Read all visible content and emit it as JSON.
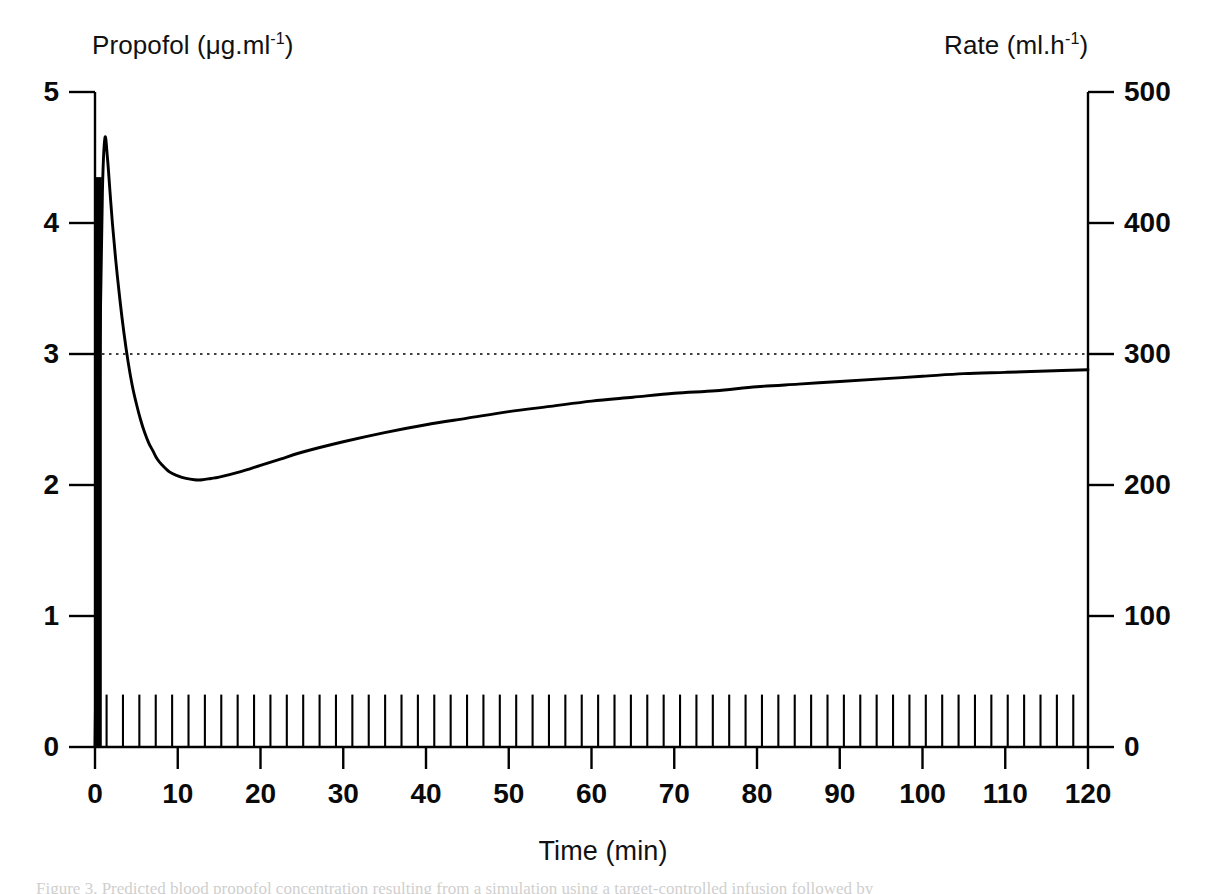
{
  "figure": {
    "left_axis_title_text": "Propofol (μg.ml",
    "left_axis_title_sup": "-1",
    "left_axis_title_close": ")",
    "right_axis_title_text": "Rate (ml.h",
    "right_axis_title_sup": "-1",
    "right_axis_title_close": ")",
    "x_axis_title": "Time (min)",
    "caption_partial": "Figure 3. Predicted blood propofol concentration resulting from a simulation using a target-controlled infusion followed by"
  },
  "chart_data": {
    "type": "line",
    "title": "",
    "xlabel": "Time (min)",
    "ylabel": "Propofol (μg.ml-1)",
    "y2label": "Rate (ml.h-1)",
    "xlim": [
      0,
      120
    ],
    "ylim": [
      0,
      5
    ],
    "y2lim": [
      0,
      500
    ],
    "grid": false,
    "legend": "none",
    "xticks": [
      0,
      10,
      20,
      30,
      40,
      50,
      60,
      70,
      80,
      90,
      100,
      110,
      120
    ],
    "xtick_labels": [
      "0",
      "10",
      "20",
      "30",
      "40",
      "50",
      "60",
      "70",
      "80",
      "90",
      "100",
      "110",
      "120"
    ],
    "yticks": [
      0,
      1,
      2,
      3,
      4,
      5
    ],
    "ytick_labels": [
      "0",
      "1",
      "2",
      "3",
      "4",
      "5"
    ],
    "y2ticks": [
      0,
      100,
      200,
      300,
      400,
      500
    ],
    "y2tick_labels": [
      "0",
      "100",
      "200",
      "300",
      "400",
      "500"
    ],
    "annotations": [
      {
        "name": "target-concentration-reference-line",
        "kind": "horizontal-dotted-line",
        "y": 3.0,
        "y2_equivalent": 300,
        "label": ""
      }
    ],
    "series": [
      {
        "name": "Predicted propofol blood concentration",
        "axis": "left",
        "style": "solid-line",
        "color": "#000000",
        "units": "μg.ml-1",
        "x": [
          0,
          0.3,
          0.6,
          0.9,
          1.2,
          1.5,
          1.8,
          2.1,
          2.5,
          3,
          3.5,
          4,
          4.5,
          5,
          5.5,
          6,
          6.5,
          7,
          7.5,
          8,
          9,
          10,
          11,
          12,
          13,
          14,
          15,
          17.5,
          20,
          22.5,
          25,
          30,
          35,
          40,
          45,
          50,
          55,
          60,
          65,
          70,
          75,
          80,
          85,
          90,
          95,
          100,
          105,
          110,
          115,
          120
        ],
        "y": [
          0.0,
          1.55,
          3.1,
          4.25,
          4.65,
          4.5,
          4.25,
          4.0,
          3.72,
          3.42,
          3.16,
          2.94,
          2.76,
          2.62,
          2.5,
          2.4,
          2.32,
          2.26,
          2.2,
          2.16,
          2.1,
          2.07,
          2.05,
          2.04,
          2.04,
          2.05,
          2.06,
          2.1,
          2.15,
          2.2,
          2.25,
          2.33,
          2.4,
          2.46,
          2.51,
          2.56,
          2.6,
          2.64,
          2.67,
          2.7,
          2.72,
          2.75,
          2.77,
          2.79,
          2.81,
          2.83,
          2.85,
          2.86,
          2.87,
          2.88
        ]
      },
      {
        "name": "Infusion rate bolus bar",
        "axis": "right",
        "style": "thick-vertical-bar",
        "color": "#000000",
        "units": "ml.h-1",
        "x": [
          0.35
        ],
        "y": [
          435
        ],
        "bar_width_minutes": 0.75
      },
      {
        "name": "Infusion rate maintenance bars",
        "axis": "right",
        "style": "thin-vertical-bars",
        "color": "#000000",
        "units": "ml.h-1",
        "bar_value": 40,
        "bar_count": 60,
        "x_start": 1.4,
        "x_step": 1.98,
        "bar_width_minutes": 0.16
      }
    ]
  }
}
